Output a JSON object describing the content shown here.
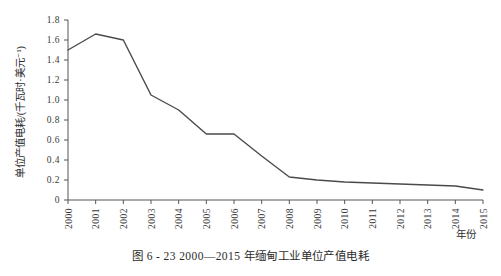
{
  "figure": {
    "caption": "图 6 - 23    2000—2015 年缅甸工业单位产值电耗"
  },
  "chart_data": {
    "type": "line",
    "title": "",
    "xlabel": "年份",
    "ylabel": "单位产值电耗/(千瓦时·美元⁻¹)",
    "categories": [
      "2000",
      "2001",
      "2002",
      "2003",
      "2004",
      "2005",
      "2006",
      "2007",
      "2008",
      "2009",
      "2010",
      "2011",
      "2012",
      "2013",
      "2014",
      "2015"
    ],
    "values": [
      1.5,
      1.66,
      1.6,
      1.05,
      0.9,
      0.66,
      0.66,
      0.44,
      0.23,
      0.2,
      0.18,
      0.17,
      0.16,
      0.15,
      0.14,
      0.1
    ],
    "ylim": [
      0,
      1.8
    ],
    "ytick_labels": [
      "0",
      "0.2",
      "0.4",
      "0.6",
      "0.8",
      "1.0",
      "1.2",
      "1.4",
      "1.6",
      "1.8"
    ],
    "ytick_values": [
      0,
      0.2,
      0.4,
      0.6,
      0.8,
      1.0,
      1.2,
      1.4,
      1.6,
      1.8
    ],
    "grid": false,
    "legend": "none",
    "line_color": "#4a4a4a",
    "axis_color": "#555555"
  }
}
